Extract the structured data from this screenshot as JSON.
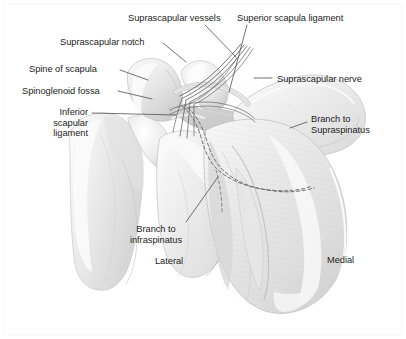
{
  "figure": {
    "kind": "anatomical-illustration",
    "background_color": "#ffffff",
    "label_text_color": "#242424",
    "leader_line_color": "#555555",
    "bone_fill_color": "#f2f2f2",
    "bone_shade_color": "#d3d3d3",
    "bone_outline_color": "#b8b8b8",
    "vessel_color": "#4a4a4a",
    "nerve_dash_color": "#6b6b6b"
  },
  "labels": {
    "suprascapular_vessels": "Suprascapular vessels",
    "superior_scapula_ligament": "Superior scapula ligament",
    "suprascapular_notch": "Suprascapular notch",
    "spine_of_scapula": "Spine of scapula",
    "suprascapular_nerve": "Suprascapular nerve",
    "spinoglenoid_fossa": "Spinoglenoid fossa",
    "inferior_scapular_ligament": "Inferior\nscapular\nligament",
    "branch_to_supraspinatus": "Branch to\nSupraspinatus",
    "branch_to_infraspinatus": "Branch to\ninfraspinatus",
    "lateral": "Lateral",
    "medial": "Medial"
  }
}
